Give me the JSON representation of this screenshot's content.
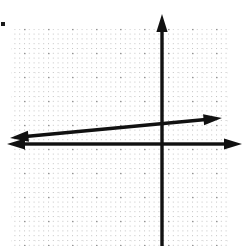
{
  "figure": {
    "title": "Coordinate plane with a line graphed",
    "background_color": "#ffffff",
    "width": 245,
    "height": 246
  },
  "grid": {
    "style": "dotted",
    "dot_color": "#b9b9b9",
    "major_color": "#9a9a9a",
    "left": 12,
    "top": 29,
    "right": 228,
    "bottom": 246,
    "cell_size": 24,
    "minor_dot_spacing": 4.8,
    "columns": 9,
    "rows": 9,
    "visible": true
  },
  "axes": {
    "color": "#111111",
    "stroke_width": 3.4,
    "origin_x": 162,
    "origin_y": 144,
    "x_axis": {
      "label": "x-axis",
      "y": 144,
      "start_x": 7,
      "end_x": 242,
      "arrow_left": true,
      "arrow_right": true
    },
    "y_axis": {
      "label": "y-axis",
      "x": 162,
      "start_y": 14,
      "end_y": 246,
      "arrow_top": true,
      "arrow_bottom": false
    }
  },
  "marker": {
    "name": "corner-dot",
    "x": 2,
    "y": 23,
    "size": 4,
    "color": "#1a1a1a"
  },
  "chart_data": {
    "type": "line",
    "title": "Coordinate plane with a line graphed",
    "xlabel": "x",
    "ylabel": "y",
    "grid": true,
    "legend": "none",
    "xlim": [
      -6.25,
      3.5
    ],
    "ylim": [
      -4.25,
      5.4
    ],
    "units_per_cell": 1,
    "pixels_per_unit": 24,
    "series": [
      {
        "name": "line-1",
        "color": "#111111",
        "stroke_width": 3.4,
        "arrow_start": true,
        "arrow_end": true,
        "slope": 0.094,
        "y_intercept": 0.58,
        "x_intercept": -6.2,
        "points_px": [
          {
            "x": 10,
            "y": 138
          },
          {
            "x": 222,
            "y": 118
          }
        ],
        "points_data": [
          {
            "x": -6.33,
            "y": -0.25
          },
          {
            "x": 2.5,
            "y": 1.08
          }
        ]
      }
    ],
    "annotations": []
  }
}
